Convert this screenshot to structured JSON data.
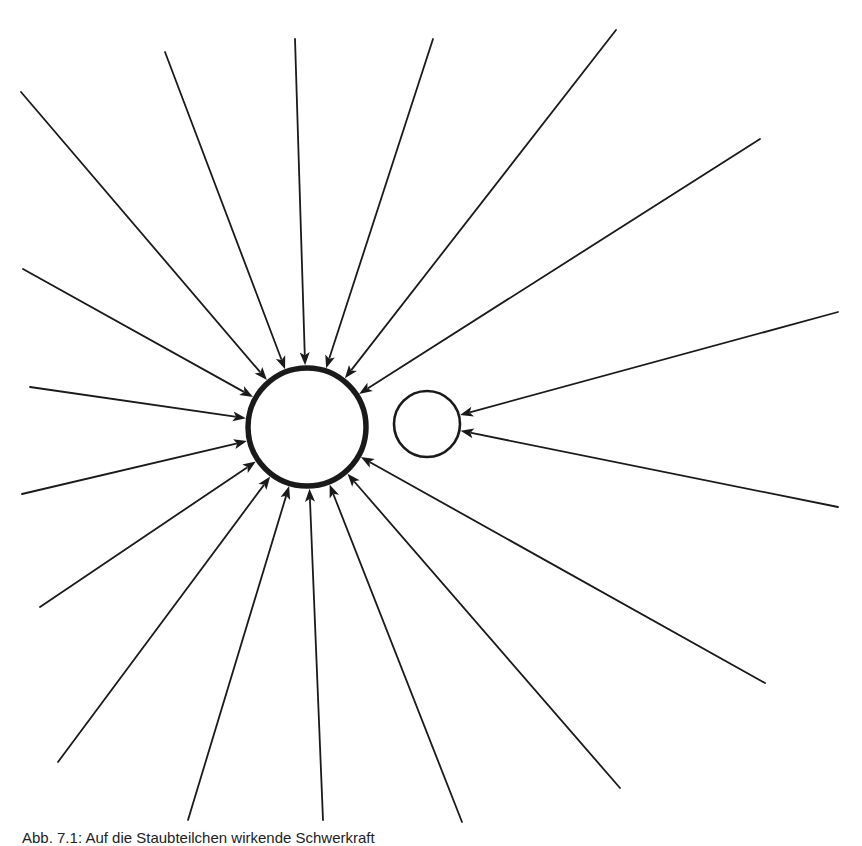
{
  "figure": {
    "width": 862,
    "height": 842,
    "background": "#ffffff",
    "stroke_color": "#1a1a1a",
    "caption": "Abb. 7.1: Auf die Staubteilchen wirkende Schwerkraft",
    "big_body": {
      "cx": 307,
      "cy": 427,
      "r": 59,
      "stroke_width": 5.5
    },
    "small_body": {
      "cx": 427,
      "cy": 424,
      "r": 33,
      "stroke_width": 2.6
    },
    "arrows_to_big": [
      [
        21,
        92
      ],
      [
        165,
        52
      ],
      [
        295,
        39
      ],
      [
        433,
        39
      ],
      [
        616,
        30
      ],
      [
        760,
        139
      ],
      [
        23,
        269
      ],
      [
        30,
        387
      ],
      [
        22,
        494
      ],
      [
        40,
        607
      ],
      [
        58,
        762
      ],
      [
        188,
        820
      ],
      [
        323,
        820
      ],
      [
        462,
        822
      ],
      [
        620,
        788
      ],
      [
        765,
        683
      ]
    ],
    "arrows_to_small": [
      [
        838,
        312
      ],
      [
        838,
        507
      ]
    ]
  }
}
